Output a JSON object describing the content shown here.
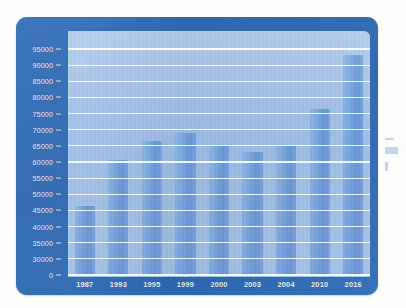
{
  "chart_data": {
    "type": "bar",
    "title": "",
    "subtitle": "",
    "xlabel": "",
    "ylabel": "",
    "categories": [
      "1987",
      "1993",
      "1995",
      "1999",
      "2000",
      "2003",
      "2004",
      "2010",
      "2016"
    ],
    "values": [
      46500,
      60500,
      66500,
      69000,
      65000,
      63000,
      65000,
      76500,
      93000
    ],
    "series": [
      {
        "name": "",
        "values": [
          46500,
          60500,
          66500,
          69000,
          65000,
          63000,
          65000,
          76500,
          93000
        ]
      }
    ],
    "ytick_labels": [
      "95000",
      "90000",
      "85000",
      "80000",
      "75000",
      "70000",
      "65000",
      "60000",
      "55000",
      "50000",
      "45000",
      "40000",
      "35000",
      "30000",
      "0"
    ],
    "ytick_values": [
      95000,
      90000,
      85000,
      80000,
      75000,
      70000,
      65000,
      60000,
      55000,
      50000,
      45000,
      40000,
      35000,
      30000,
      0
    ],
    "ylim": [
      26500,
      97500
    ],
    "axis_break": true,
    "grid": true,
    "grid_axis": "y",
    "legend": "none",
    "legend_position": "none",
    "annotations": [],
    "colors": {
      "bar": "#6d9ddc",
      "plot_background": "#9dbde6",
      "frame": "#2d6ab4",
      "gridline": "#ffffff",
      "tick_label": "#eaf2fc"
    }
  }
}
